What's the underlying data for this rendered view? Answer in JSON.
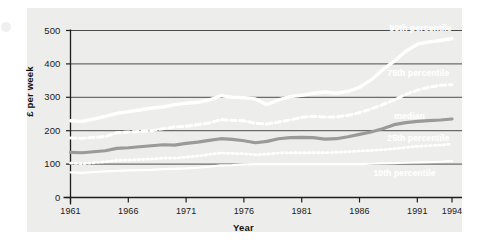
{
  "chart_data": {
    "type": "line",
    "title": "",
    "xlabel": "Year",
    "ylabel": "£ per week",
    "xlim": [
      1961,
      1994
    ],
    "ylim": [
      0,
      500
    ],
    "grid": true,
    "legend_position": "inline-right",
    "yticks": [
      "0",
      "100",
      "200",
      "300",
      "400",
      "500"
    ],
    "ytick_values": [
      0,
      100,
      200,
      300,
      400,
      500
    ],
    "xticks": [
      "1961",
      "1966",
      "1971",
      "1976",
      "1981",
      "1986",
      "1991",
      "1994"
    ],
    "xtick_values": [
      1961,
      1966,
      1971,
      1976,
      1981,
      1986,
      1991,
      1994
    ],
    "x": [
      1961,
      1962,
      1963,
      1964,
      1965,
      1966,
      1967,
      1968,
      1969,
      1970,
      1971,
      1972,
      1973,
      1974,
      1975,
      1976,
      1977,
      1978,
      1979,
      1980,
      1981,
      1982,
      1983,
      1984,
      1985,
      1986,
      1987,
      1988,
      1989,
      1990,
      1991,
      1992,
      1993,
      1994
    ],
    "series": [
      {
        "name": "90th percentile",
        "style": "solid-thick-white",
        "color": "#ffffff",
        "label_x": 1988.6,
        "label_y": 508,
        "values": [
          230,
          228,
          235,
          243,
          252,
          257,
          262,
          268,
          271,
          278,
          282,
          285,
          292,
          305,
          300,
          299,
          295,
          278,
          292,
          302,
          306,
          312,
          316,
          312,
          318,
          330,
          352,
          382,
          408,
          438,
          459,
          466,
          470,
          476
        ]
      },
      {
        "name": "75th percentile",
        "style": "dashed-white",
        "color": "#ffffff",
        "label_x": 1988.4,
        "label_y": 372,
        "values": [
          178,
          177,
          180,
          182,
          194,
          196,
          198,
          200,
          206,
          211,
          213,
          218,
          223,
          233,
          231,
          230,
          222,
          220,
          226,
          232,
          240,
          243,
          241,
          241,
          246,
          254,
          265,
          278,
          292,
          309,
          321,
          330,
          336,
          338
        ]
      },
      {
        "name": "median",
        "style": "solid-thick-gray",
        "color": "#9a9a9a",
        "label_x": 1989.0,
        "label_y": 244,
        "values": [
          135,
          134,
          137,
          140,
          147,
          149,
          152,
          155,
          158,
          157,
          162,
          166,
          171,
          176,
          174,
          170,
          164,
          168,
          176,
          179,
          180,
          179,
          175,
          176,
          182,
          189,
          196,
          206,
          218,
          224,
          228,
          230,
          232,
          235
        ]
      },
      {
        "name": "25th percentile",
        "style": "dotted-white",
        "color": "#ffffff",
        "label_x": 1988.4,
        "label_y": 177,
        "values": [
          103,
          101,
          104,
          107,
          111,
          112,
          114,
          115,
          118,
          118,
          121,
          124,
          129,
          133,
          132,
          131,
          128,
          130,
          133,
          134,
          134,
          134,
          134,
          135,
          137,
          139,
          141,
          143,
          146,
          150,
          153,
          155,
          157,
          160
        ]
      },
      {
        "name": "10th percentile",
        "style": "solid-thin-white",
        "color": "#ffffff",
        "label_x": 1987.2,
        "label_y": 74,
        "values": [
          75,
          74,
          76,
          78,
          80,
          81,
          82,
          83,
          85,
          86,
          87,
          89,
          92,
          96,
          97,
          99,
          100,
          100,
          100,
          100,
          100,
          100,
          100,
          100,
          100,
          100,
          101,
          102,
          103,
          104,
          105,
          106,
          107,
          110
        ]
      }
    ]
  }
}
